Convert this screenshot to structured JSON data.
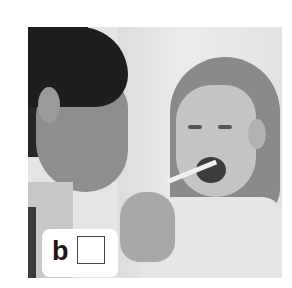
{
  "photo": {
    "description": "Woman with dark hair examining girl's throat with a tongue depressor",
    "label": "b",
    "checkbox": {
      "checked": false
    }
  }
}
